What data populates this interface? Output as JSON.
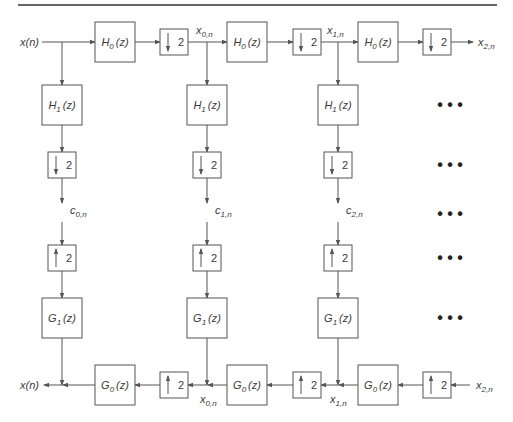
{
  "diagram": {
    "type": "wavelet-filter-bank",
    "signals": {
      "input": "x(n)",
      "output": "x(n)",
      "x0": {
        "base": "x",
        "sub": "0,n"
      },
      "x1": {
        "base": "x",
        "sub": "1,n"
      },
      "x2": {
        "base": "x",
        "sub": "2,n"
      },
      "c0": {
        "base": "c",
        "sub": "0,n"
      },
      "c1": {
        "base": "c",
        "sub": "1,n"
      },
      "c2": {
        "base": "c",
        "sub": "2,n"
      }
    },
    "filters": {
      "H0": {
        "base": "H",
        "sub": "0",
        "arg": "(z)"
      },
      "H1": {
        "base": "H",
        "sub": "1",
        "arg": "(z)"
      },
      "G0": {
        "base": "G",
        "sub": "0",
        "arg": "(z)"
      },
      "G1": {
        "base": "G",
        "sub": "1",
        "arg": "(z)"
      }
    },
    "downsample": {
      "factor": "2",
      "arrow": "down"
    },
    "upsample": {
      "factor": "2",
      "arrow": "up"
    },
    "ellipsis": "• • •"
  }
}
